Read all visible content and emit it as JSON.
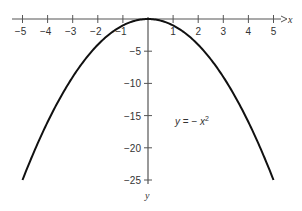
{
  "chart_data": {
    "type": "line",
    "title": "",
    "xlabel": "x",
    "ylabel": "y",
    "xlim": [
      -5,
      5
    ],
    "ylim": [
      -25,
      0
    ],
    "grid": false,
    "x_ticks": [
      -5,
      -4,
      -3,
      -2,
      -1,
      1,
      2,
      3,
      4,
      5
    ],
    "x_tick_labels": [
      "−5",
      "−4",
      "−3",
      "−2",
      "−1",
      "1",
      "2",
      "3",
      "4",
      "5"
    ],
    "y_ticks": [
      -5,
      -10,
      -15,
      -20,
      -25
    ],
    "y_tick_labels": [
      "−5",
      "−10",
      "−15",
      "−20",
      "−25"
    ],
    "series": [
      {
        "name": "y = −x²",
        "function": "y = -x^2",
        "x": [
          -5,
          -4,
          -3,
          -2,
          -1,
          0,
          1,
          2,
          3,
          4,
          5
        ],
        "values": [
          -25,
          -16,
          -9,
          -4,
          -1,
          0,
          -1,
          -4,
          -9,
          -16,
          -25
        ]
      }
    ],
    "annotations": [
      {
        "text": "y = − x²",
        "x": 2,
        "y": -16
      }
    ]
  },
  "labels": {
    "x_axis": "x",
    "y_axis": "y",
    "equation_y": "y",
    "equation_eq": " = − ",
    "equation_x": "x",
    "equation_exp": "2"
  },
  "colors": {
    "axis": "#555555",
    "curve": "#111111",
    "text": "#333333"
  }
}
